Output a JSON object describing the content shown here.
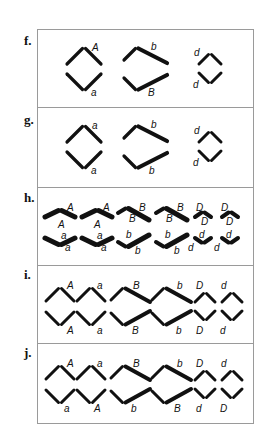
{
  "figure": {
    "frame": {
      "x": 37,
      "y": 29,
      "w": 216,
      "h": 394,
      "stroke": "#9a9a9a"
    },
    "dividers_y": [
      107,
      187,
      265,
      343
    ],
    "stick_color": "#111111",
    "panels": [
      {
        "id": "f",
        "label": "f.",
        "label_pos": [
          24,
          45
        ],
        "description": "Three separated chromosome pairs: A/a, b/B, d/d",
        "shapes": [
          {
            "kind": "chevron-up",
            "apex": [
              84,
              47
            ],
            "arm": [
              17,
              17
            ],
            "w": 3.2
          },
          {
            "kind": "chevron-down",
            "apex": [
              84,
              91
            ],
            "arm": [
              17,
              17
            ],
            "w": 3.2
          },
          {
            "kind": "chevron-up-long",
            "apex": [
              137,
              47
            ],
            "left": [
              13,
              13
            ],
            "right": [
              30,
              16
            ],
            "w": [
              3.2,
              4.2
            ]
          },
          {
            "kind": "chevron-down-long",
            "apex": [
              137,
              91
            ],
            "left": [
              13,
              13
            ],
            "right": [
              30,
              16
            ],
            "w": [
              3.2,
              4.2
            ]
          },
          {
            "kind": "chevron-up",
            "apex": [
              210,
              53
            ],
            "arm": [
              11,
              11
            ],
            "w": 3
          },
          {
            "kind": "chevron-down",
            "apex": [
              210,
              84
            ],
            "arm": [
              11,
              11
            ],
            "w": 3
          }
        ],
        "labels": [
          {
            "text": "A",
            "x": 92,
            "y": 51
          },
          {
            "text": "a",
            "x": 91,
            "y": 96
          },
          {
            "text": "b",
            "x": 151,
            "y": 50
          },
          {
            "text": "B",
            "x": 148,
            "y": 96
          },
          {
            "text": "d",
            "x": 194,
            "y": 56
          },
          {
            "text": "d",
            "x": 193,
            "y": 88
          }
        ]
      },
      {
        "id": "g",
        "label": "g.",
        "label_pos": [
          24,
          124
        ],
        "description": "Three pairs: a/a, b/b, d/d",
        "shapes": [
          {
            "kind": "chevron-up",
            "apex": [
              84,
              125
            ],
            "arm": [
              17,
              17
            ],
            "w": 3.2
          },
          {
            "kind": "chevron-down",
            "apex": [
              84,
              169
            ],
            "arm": [
              17,
              17
            ],
            "w": 3.2
          },
          {
            "kind": "chevron-up-long",
            "apex": [
              137,
              125
            ],
            "left": [
              13,
              13
            ],
            "right": [
              30,
              16
            ],
            "w": [
              3.2,
              4.2
            ]
          },
          {
            "kind": "chevron-down-long",
            "apex": [
              137,
              169
            ],
            "left": [
              13,
              13
            ],
            "right": [
              30,
              16
            ],
            "w": [
              3.2,
              4.2
            ]
          },
          {
            "kind": "chevron-up",
            "apex": [
              210,
              131
            ],
            "arm": [
              11,
              11
            ],
            "w": 3
          },
          {
            "kind": "chevron-down",
            "apex": [
              210,
              162
            ],
            "arm": [
              11,
              11
            ],
            "w": 3
          }
        ],
        "labels": [
          {
            "text": "a",
            "x": 92,
            "y": 129
          },
          {
            "text": "a",
            "x": 91,
            "y": 174
          },
          {
            "text": "b",
            "x": 151,
            "y": 128
          },
          {
            "text": "b",
            "x": 149,
            "y": 174
          },
          {
            "text": "d",
            "x": 194,
            "y": 134
          },
          {
            "text": "d",
            "x": 193,
            "y": 166
          }
        ]
      },
      {
        "id": "h",
        "label": "h.",
        "label_pos": [
          24,
          202
        ],
        "description": "Paired duplicated chromosomes: A/A, A/A, B/B, B/B, D/D, D/D over a/a, a/a, b/b, b/b, d/d, d/d",
        "shapes": [
          {
            "kind": "flat-up",
            "apex": [
              60,
              209
            ],
            "arm": [
              15,
              8
            ],
            "w": 5
          },
          {
            "kind": "flat-up",
            "apex": [
              97,
              209
            ],
            "arm": [
              15,
              8
            ],
            "w": 5
          },
          {
            "kind": "flat-up-long",
            "apex": [
              127,
              207
            ],
            "left": [
              9,
              6
            ],
            "right": [
              22,
              13
            ],
            "w": [
              4,
              5
            ]
          },
          {
            "kind": "flat-up-long",
            "apex": [
              165,
              207
            ],
            "left": [
              9,
              6
            ],
            "right": [
              22,
              13
            ],
            "w": [
              4,
              5
            ]
          },
          {
            "kind": "flat-up",
            "apex": [
              203,
              211
            ],
            "arm": [
              8,
              6
            ],
            "w": 4
          },
          {
            "kind": "flat-up",
            "apex": [
              230,
              211
            ],
            "arm": [
              8,
              6
            ],
            "w": 4
          },
          {
            "kind": "flat-down",
            "apex": [
              60,
              246
            ],
            "arm": [
              15,
              8
            ],
            "w": 5
          },
          {
            "kind": "flat-down",
            "apex": [
              97,
              246
            ],
            "arm": [
              15,
              8
            ],
            "w": 5
          },
          {
            "kind": "flat-down-long",
            "apex": [
              127,
              248
            ],
            "left": [
              9,
              6
            ],
            "right": [
              22,
              13
            ],
            "w": [
              4,
              5
            ]
          },
          {
            "kind": "flat-down-long",
            "apex": [
              165,
              248
            ],
            "left": [
              9,
              6
            ],
            "right": [
              22,
              13
            ],
            "w": [
              4,
              5
            ]
          },
          {
            "kind": "flat-down",
            "apex": [
              203,
              244
            ],
            "arm": [
              8,
              6
            ],
            "w": 4
          },
          {
            "kind": "flat-down",
            "apex": [
              230,
              244
            ],
            "arm": [
              8,
              6
            ],
            "w": 4
          }
        ],
        "labels": [
          {
            "text": "A",
            "x": 67,
            "y": 211
          },
          {
            "text": "A",
            "x": 58,
            "y": 228
          },
          {
            "text": "A",
            "x": 103,
            "y": 211
          },
          {
            "text": "A",
            "x": 94,
            "y": 228
          },
          {
            "text": "B",
            "x": 139,
            "y": 211
          },
          {
            "text": "B",
            "x": 129,
            "y": 222
          },
          {
            "text": "B",
            "x": 177,
            "y": 211
          },
          {
            "text": "B",
            "x": 166,
            "y": 222
          },
          {
            "text": "D",
            "x": 196,
            "y": 211
          },
          {
            "text": "D",
            "x": 201,
            "y": 225
          },
          {
            "text": "D",
            "x": 221,
            "y": 211
          },
          {
            "text": "D",
            "x": 226,
            "y": 225
          },
          {
            "text": "a",
            "x": 61,
            "y": 239
          },
          {
            "text": "a",
            "x": 65,
            "y": 251
          },
          {
            "text": "a",
            "x": 97,
            "y": 239
          },
          {
            "text": "a",
            "x": 101,
            "y": 251
          },
          {
            "text": "b",
            "x": 126,
            "y": 238
          },
          {
            "text": "b",
            "x": 135,
            "y": 254
          },
          {
            "text": "b",
            "x": 165,
            "y": 238
          },
          {
            "text": "b",
            "x": 174,
            "y": 254
          },
          {
            "text": "d",
            "x": 199,
            "y": 238
          },
          {
            "text": "d",
            "x": 188,
            "y": 251
          },
          {
            "text": "d",
            "x": 226,
            "y": 238
          },
          {
            "text": "d",
            "x": 214,
            "y": 251
          }
        ]
      },
      {
        "id": "i",
        "label": "i.",
        "label_pos": [
          24,
          279
        ],
        "description": "Sister chromatids aligned: top A a B b D d, bottom A a B b D d",
        "shapes": [
          {
            "kind": "chevron-up",
            "apex": [
              60,
              287
            ],
            "arm": [
              14,
              14
            ],
            "w": 3
          },
          {
            "kind": "chevron-up",
            "apex": [
              91,
              287
            ],
            "arm": [
              14,
              14
            ],
            "w": 3
          },
          {
            "kind": "chevron-up-long",
            "apex": [
              124,
              287
            ],
            "left": [
              13,
              13
            ],
            "right": [
              26,
              15
            ],
            "w": [
              3,
              4
            ]
          },
          {
            "kind": "chevron-up-long",
            "apex": [
              165,
              287
            ],
            "left": [
              13,
              13
            ],
            "right": [
              26,
              15
            ],
            "w": [
              3,
              4
            ]
          },
          {
            "kind": "chevron-up",
            "apex": [
              205,
              292
            ],
            "arm": [
              10,
              10
            ],
            "w": 3
          },
          {
            "kind": "chevron-up",
            "apex": [
              232,
              292
            ],
            "arm": [
              10,
              10
            ],
            "w": 3
          },
          {
            "kind": "chevron-down",
            "apex": [
              60,
              326
            ],
            "arm": [
              14,
              14
            ],
            "w": 3
          },
          {
            "kind": "chevron-down",
            "apex": [
              91,
              326
            ],
            "arm": [
              14,
              14
            ],
            "w": 3
          },
          {
            "kind": "chevron-down-long",
            "apex": [
              124,
              326
            ],
            "left": [
              13,
              13
            ],
            "right": [
              26,
              15
            ],
            "w": [
              3,
              4
            ]
          },
          {
            "kind": "chevron-down-long",
            "apex": [
              165,
              326
            ],
            "left": [
              13,
              13
            ],
            "right": [
              26,
              15
            ],
            "w": [
              3,
              4
            ]
          },
          {
            "kind": "chevron-down",
            "apex": [
              205,
              321
            ],
            "arm": [
              10,
              10
            ],
            "w": 3
          },
          {
            "kind": "chevron-down",
            "apex": [
              232,
              321
            ],
            "arm": [
              10,
              10
            ],
            "w": 3
          }
        ],
        "labels": [
          {
            "text": "A",
            "x": 67,
            "y": 289
          },
          {
            "text": "a",
            "x": 97,
            "y": 289
          },
          {
            "text": "B",
            "x": 133,
            "y": 289
          },
          {
            "text": "b",
            "x": 177,
            "y": 289
          },
          {
            "text": "D",
            "x": 196,
            "y": 289
          },
          {
            "text": "d",
            "x": 221,
            "y": 289
          },
          {
            "text": "A",
            "x": 67,
            "y": 334
          },
          {
            "text": "a",
            "x": 97,
            "y": 334
          },
          {
            "text": "B",
            "x": 132,
            "y": 334
          },
          {
            "text": "b",
            "x": 176,
            "y": 334
          },
          {
            "text": "D",
            "x": 196,
            "y": 334
          },
          {
            "text": "d",
            "x": 220,
            "y": 334
          }
        ]
      },
      {
        "id": "j",
        "label": "j.",
        "label_pos": [
          24,
          357
        ],
        "description": "Alternative alignment: top A a B b D d, bottom a A b B d D",
        "shapes": [
          {
            "kind": "chevron-up",
            "apex": [
              60,
              365
            ],
            "arm": [
              14,
              14
            ],
            "w": 3
          },
          {
            "kind": "chevron-up",
            "apex": [
              91,
              365
            ],
            "arm": [
              14,
              14
            ],
            "w": 3
          },
          {
            "kind": "chevron-up-long",
            "apex": [
              124,
              365
            ],
            "left": [
              13,
              13
            ],
            "right": [
              26,
              15
            ],
            "w": [
              3,
              4
            ]
          },
          {
            "kind": "chevron-up-long",
            "apex": [
              165,
              365
            ],
            "left": [
              13,
              13
            ],
            "right": [
              26,
              15
            ],
            "w": [
              3,
              4
            ]
          },
          {
            "kind": "chevron-up",
            "apex": [
              205,
              370
            ],
            "arm": [
              10,
              10
            ],
            "w": 3
          },
          {
            "kind": "chevron-up",
            "apex": [
              232,
              370
            ],
            "arm": [
              10,
              10
            ],
            "w": 3
          },
          {
            "kind": "chevron-down",
            "apex": [
              60,
              404
            ],
            "arm": [
              14,
              14
            ],
            "w": 3
          },
          {
            "kind": "chevron-down",
            "apex": [
              91,
              404
            ],
            "arm": [
              14,
              14
            ],
            "w": 3
          },
          {
            "kind": "chevron-down-long",
            "apex": [
              124,
              404
            ],
            "left": [
              13,
              13
            ],
            "right": [
              26,
              15
            ],
            "w": [
              3,
              4
            ]
          },
          {
            "kind": "chevron-down-long",
            "apex": [
              165,
              404
            ],
            "left": [
              13,
              13
            ],
            "right": [
              26,
              15
            ],
            "w": [
              3,
              4
            ]
          },
          {
            "kind": "chevron-down",
            "apex": [
              205,
              399
            ],
            "arm": [
              10,
              10
            ],
            "w": 3
          },
          {
            "kind": "chevron-down",
            "apex": [
              232,
              399
            ],
            "arm": [
              10,
              10
            ],
            "w": 3
          }
        ],
        "labels": [
          {
            "text": "A",
            "x": 67,
            "y": 367
          },
          {
            "text": "a",
            "x": 97,
            "y": 367
          },
          {
            "text": "B",
            "x": 133,
            "y": 367
          },
          {
            "text": "b",
            "x": 177,
            "y": 367
          },
          {
            "text": "D",
            "x": 196,
            "y": 367
          },
          {
            "text": "d",
            "x": 221,
            "y": 367
          },
          {
            "text": "a",
            "x": 64,
            "y": 412
          },
          {
            "text": "A",
            "x": 94,
            "y": 412
          },
          {
            "text": "b",
            "x": 131,
            "y": 412
          },
          {
            "text": "B",
            "x": 174,
            "y": 412
          },
          {
            "text": "d",
            "x": 196,
            "y": 412
          },
          {
            "text": "D",
            "x": 220,
            "y": 412
          }
        ]
      }
    ]
  }
}
